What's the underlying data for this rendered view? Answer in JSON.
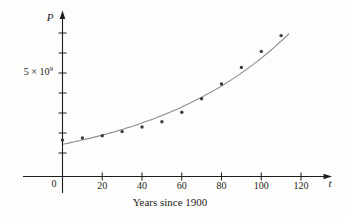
{
  "figure": {
    "background": "#fdfdfc",
    "colors": {
      "axis": "#1d1d1b",
      "text": "#1d1d1b",
      "curve": "#8e8e8c",
      "point": "#3c3c3a"
    }
  },
  "chart_data": {
    "type": "scatter",
    "title": "",
    "xlabel": "Years since 1900",
    "x_axis_symbol": "t",
    "y_axis_symbol": "P",
    "origin_label": "0",
    "x_ticks": [
      20,
      40,
      60,
      80,
      100,
      120
    ],
    "y_ticks_billions": [
      1,
      2,
      3,
      4,
      5,
      6,
      7
    ],
    "y_tick_label": {
      "mantissa": "5 × 10",
      "exponent": "9",
      "value_billions": 5
    },
    "points": {
      "x_years_since_1900": [
        0,
        10,
        20,
        30,
        40,
        50,
        60,
        70,
        80,
        90,
        100,
        110
      ],
      "population_billions": [
        1.65,
        1.75,
        1.86,
        2.07,
        2.3,
        2.56,
        3.04,
        3.71,
        4.45,
        5.28,
        6.08,
        6.87
      ]
    },
    "model_curve": {
      "type": "exponential",
      "formula": "P = a · b^t",
      "a_billions": 1.4365,
      "b": 1.01395,
      "t_range": [
        0,
        114
      ]
    },
    "axes": {
      "x_range_shown": [
        0,
        130
      ],
      "y_range_shown_billions": [
        0,
        8
      ],
      "grid": false,
      "legend": false
    }
  }
}
